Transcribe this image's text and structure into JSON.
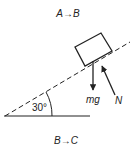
{
  "diagram": {
    "title_top": "A→B",
    "title_bottom": "B→C",
    "angle_label": "30°",
    "forces": [
      {
        "name": "weight",
        "label": "mg",
        "direction": "down"
      },
      {
        "name": "normal",
        "label": "N",
        "direction": "perpendicular-to-incline"
      }
    ],
    "incline_angle_deg": 30,
    "colors": {
      "line": "#222222",
      "background": "#ffffff"
    }
  }
}
